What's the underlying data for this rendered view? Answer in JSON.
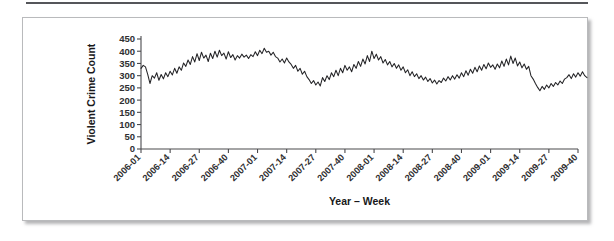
{
  "figure": {
    "panel_background": "#ffffff",
    "border_color": "#b9babc",
    "rule_color": "#55565a"
  },
  "chart_data": {
    "type": "line",
    "title": "",
    "subtitle": "",
    "xlabel": "Year – Week",
    "ylabel": "Violent Crime Count",
    "ylim": [
      0,
      450
    ],
    "yticks": [
      0,
      50,
      100,
      150,
      200,
      250,
      300,
      350,
      400,
      450
    ],
    "ytick_labels": [
      "0",
      "50",
      "100",
      "150",
      "200",
      "250",
      "300",
      "350",
      "400",
      "450"
    ],
    "grid": false,
    "legend": null,
    "legend_position": "none",
    "line_color": "#232326",
    "xtick_labels": [
      "2006-01",
      "2006-14",
      "2006-27",
      "2006-40",
      "2007-01",
      "2007-14",
      "2007-27",
      "2007-40",
      "2008-01",
      "2008-14",
      "2008-27",
      "2008-40",
      "2009-01",
      "2009-14",
      "2009-27",
      "2009-40"
    ],
    "xtick_indices": [
      0,
      13,
      26,
      39,
      52,
      65,
      78,
      91,
      104,
      117,
      130,
      143,
      156,
      169,
      182,
      195
    ],
    "xlim_index": [
      0,
      195
    ],
    "series": [
      {
        "name": "Violent Crime Count",
        "values": [
          330,
          342,
          336,
          305,
          268,
          300,
          290,
          312,
          281,
          305,
          287,
          312,
          296,
          318,
          303,
          330,
          310,
          336,
          322,
          352,
          338,
          364,
          346,
          378,
          356,
          390,
          362,
          396,
          372,
          384,
          358,
          392,
          370,
          400,
          376,
          404,
          382,
          392,
          368,
          398,
          374,
          386,
          364,
          382,
          372,
          388,
          376,
          384,
          370,
          386,
          378,
          398,
          382,
          404,
          390,
          412,
          396,
          400,
          384,
          396,
          378,
          372,
          356,
          368,
          352,
          372,
          356,
          346,
          330,
          342,
          318,
          330,
          306,
          318,
          296,
          284,
          268,
          280,
          262,
          274,
          258,
          292,
          276,
          300,
          284,
          312,
          296,
          322,
          300,
          330,
          312,
          342,
          322,
          336,
          316,
          346,
          330,
          358,
          338,
          368,
          348,
          382,
          358,
          400,
          370,
          388,
          364,
          378,
          352,
          366,
          344,
          358,
          336,
          350,
          330,
          344,
          322,
          336,
          312,
          324,
          300,
          316,
          296,
          308,
          288,
          300,
          282,
          294,
          276,
          288,
          270,
          282,
          266,
          280,
          272,
          290,
          278,
          296,
          282,
          300,
          286,
          304,
          290,
          312,
          296,
          320,
          302,
          326,
          310,
          334,
          316,
          340,
          322,
          346,
          328,
          352,
          334,
          344,
          326,
          348,
          332,
          360,
          338,
          368,
          344,
          380,
          350,
          372,
          340,
          356,
          332,
          348,
          326,
          338,
          300,
          286,
          268,
          252,
          238,
          256,
          244,
          262,
          250,
          268,
          256,
          272,
          262,
          278,
          268,
          286,
          292,
          304,
          288,
          308,
          294,
          312,
          298,
          316,
          300,
          292
        ]
      }
    ]
  }
}
